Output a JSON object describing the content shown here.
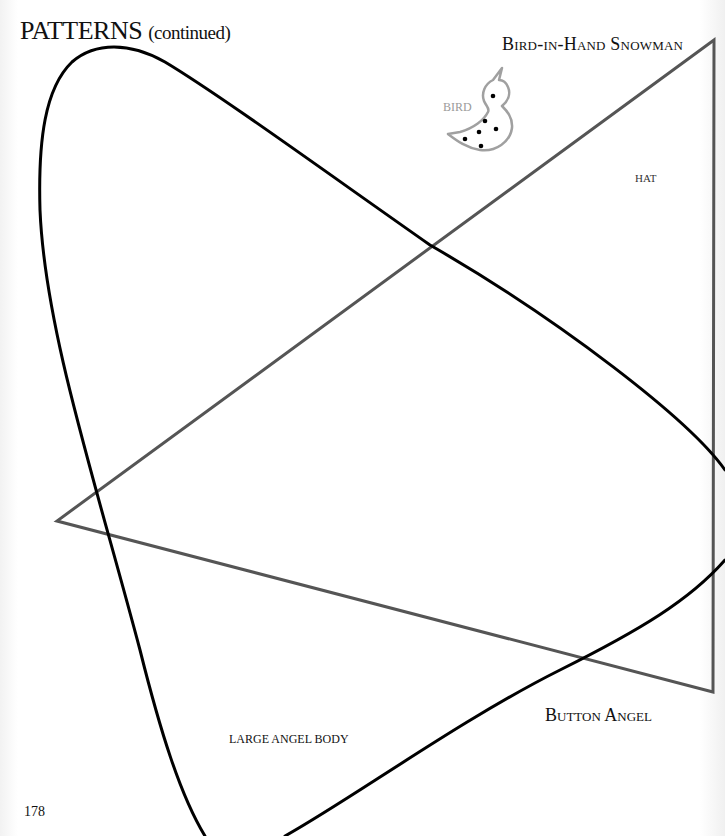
{
  "page": {
    "heading": "Patterns",
    "heading_sub": "(continued)",
    "page_number": "178"
  },
  "labels": {
    "snowman_title": "Bird-in-Hand Snowman",
    "hat": "HAT",
    "bird": "BIRD",
    "button_angel": "Button Angel",
    "large_angel_body": "LARGE ANGEL BODY"
  },
  "colors": {
    "angel_outline": "#000000",
    "hat_outline": "#555555",
    "bird_outline": "#a0a0a0",
    "bird_dots": "#000000"
  }
}
